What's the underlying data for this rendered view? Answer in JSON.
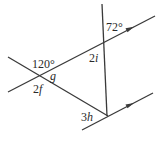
{
  "diagram": {
    "type": "geometry-angles-parallel-lines",
    "colors": {
      "line": "#3a3a3a",
      "text": "#2a2a2a",
      "background": "#ffffff"
    },
    "lines": [
      {
        "name": "upper-parallel-line",
        "x1": 8,
        "y1": 92,
        "x2": 155,
        "y2": 16,
        "arrow_at": [
          131,
          28.4
        ]
      },
      {
        "name": "lower-parallel-line",
        "x1": 82,
        "y1": 130,
        "x2": 153,
        "y2": 93,
        "arrow_at": [
          131,
          104.5
        ]
      },
      {
        "name": "crossing-transversal-line",
        "x1": 8,
        "y1": 57,
        "x2": 108,
        "y2": 116
      },
      {
        "name": "vertical-transversal-line",
        "x1": 102,
        "y1": 4,
        "x2": 107,
        "y2": 116
      }
    ],
    "labels": {
      "angle_72": {
        "num": "72",
        "unit": "°"
      },
      "angle_2i": {
        "coef": "2",
        "var": "i"
      },
      "angle_120": {
        "num": "120",
        "unit": "°"
      },
      "angle_g": {
        "var": "g"
      },
      "angle_2f": {
        "coef": "2",
        "var": "f"
      },
      "angle_3h": {
        "coef": "3",
        "var": "h"
      }
    }
  }
}
